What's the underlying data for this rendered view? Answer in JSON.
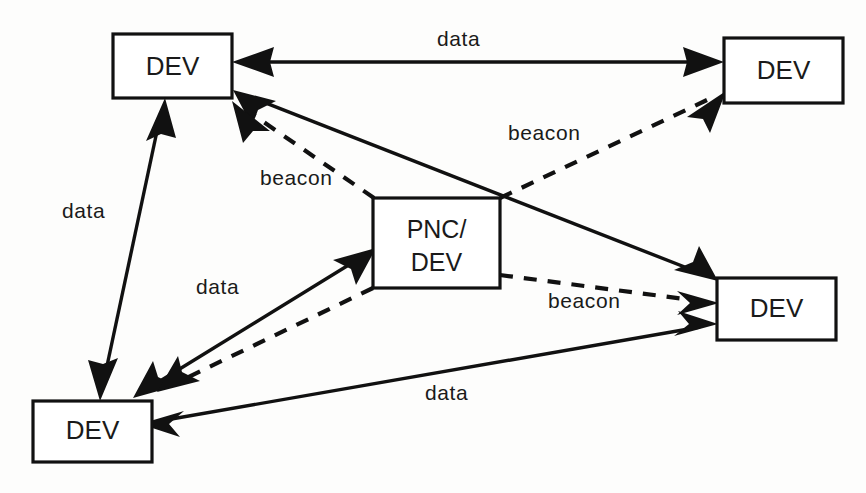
{
  "diagram": {
    "colors": {
      "stroke": "#111111",
      "fill": "#ffffff",
      "background": "#fdfdfc"
    },
    "nodes": [
      {
        "id": "dev-top-left",
        "label": "DEV",
        "x": 113,
        "y": 34,
        "w": 119,
        "h": 64
      },
      {
        "id": "dev-top-right",
        "label": "DEV",
        "x": 724,
        "y": 38,
        "w": 119,
        "h": 65
      },
      {
        "id": "pnc-dev-center",
        "label": "PNC/",
        "label2": "DEV",
        "x": 373,
        "y": 198,
        "w": 127,
        "h": 90
      },
      {
        "id": "dev-bottom-right",
        "label": "DEV",
        "x": 717,
        "y": 278,
        "w": 119,
        "h": 62
      },
      {
        "id": "dev-bottom-left",
        "label": "DEV",
        "x": 33,
        "y": 401,
        "w": 119,
        "h": 61
      }
    ],
    "edge_labels": [
      {
        "id": "label-data-top",
        "text": "data",
        "x": 437,
        "y": 46
      },
      {
        "id": "label-beacon-top-right",
        "text": "beacon",
        "x": 508,
        "y": 140
      },
      {
        "id": "label-beacon-center",
        "text": "beacon",
        "x": 260,
        "y": 185
      },
      {
        "id": "label-data-left",
        "text": "data",
        "x": 62,
        "y": 218
      },
      {
        "id": "label-data-mid-left",
        "text": "data",
        "x": 196,
        "y": 294
      },
      {
        "id": "label-beacon-right",
        "text": "beacon",
        "x": 548,
        "y": 308
      },
      {
        "id": "label-data-bottom",
        "text": "data",
        "x": 425,
        "y": 400
      }
    ],
    "edges": [
      {
        "id": "edge-data-tl-tr",
        "kind": "data",
        "style": "solid",
        "from": "dev-top-left",
        "to": "dev-top-right",
        "direction": "bidirectional"
      },
      {
        "id": "edge-data-tl-bl",
        "kind": "data",
        "style": "solid",
        "from": "dev-top-left",
        "to": "dev-bottom-left",
        "direction": "bidirectional"
      },
      {
        "id": "edge-data-tl-br",
        "kind": "data",
        "style": "solid",
        "from": "dev-top-left",
        "to": "dev-bottom-right",
        "direction": "bidirectional"
      },
      {
        "id": "edge-data-bl-pnc",
        "kind": "data",
        "style": "solid",
        "from": "dev-bottom-left",
        "to": "pnc-dev-center",
        "direction": "bidirectional"
      },
      {
        "id": "edge-data-bl-br",
        "kind": "data",
        "style": "solid",
        "from": "dev-bottom-left",
        "to": "dev-bottom-right",
        "direction": "bidirectional"
      },
      {
        "id": "edge-beacon-pnc-tl",
        "kind": "beacon",
        "style": "dashed",
        "from": "pnc-dev-center",
        "to": "dev-top-left",
        "direction": "one-way"
      },
      {
        "id": "edge-beacon-pnc-tr",
        "kind": "beacon",
        "style": "dashed",
        "from": "pnc-dev-center",
        "to": "dev-top-right",
        "direction": "one-way"
      },
      {
        "id": "edge-beacon-pnc-br",
        "kind": "beacon",
        "style": "dashed",
        "from": "pnc-dev-center",
        "to": "dev-bottom-right",
        "direction": "one-way"
      },
      {
        "id": "edge-beacon-pnc-bl",
        "kind": "beacon",
        "style": "dashed",
        "from": "pnc-dev-center",
        "to": "dev-bottom-left",
        "direction": "one-way"
      }
    ]
  }
}
